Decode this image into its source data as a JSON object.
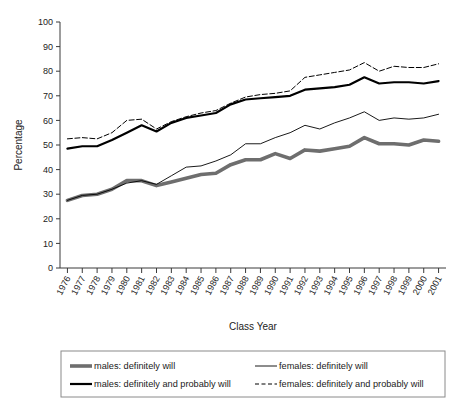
{
  "chart_data": {
    "type": "line",
    "title": "",
    "xlabel": "Class Year",
    "ylabel": "Percentage",
    "ylim": [
      0,
      100
    ],
    "ytick_step": 10,
    "yticks": [
      0,
      10,
      20,
      30,
      40,
      50,
      60,
      70,
      80,
      90,
      100
    ],
    "grid": false,
    "legend_position": "bottom",
    "x": [
      1976,
      1977,
      1978,
      1979,
      1980,
      1981,
      1982,
      1983,
      1984,
      1985,
      1986,
      1987,
      1988,
      1989,
      1990,
      1991,
      1992,
      1993,
      1994,
      1995,
      1996,
      1997,
      1998,
      1999,
      2000,
      2001
    ],
    "categories": [
      "1976",
      "1977",
      "1978",
      "1979",
      "1980",
      "1981",
      "1982",
      "1983",
      "1984",
      "1985",
      "1986",
      "1987",
      "1988",
      "1989",
      "1990",
      "1991",
      "1992",
      "1993",
      "1994",
      "1995",
      "1996",
      "1997",
      "1998",
      "1999",
      "2000",
      "2001"
    ],
    "series": [
      {
        "name": "males: definitely will",
        "style": "thick-gray",
        "color": "#6e6e6e",
        "values": [
          27.5,
          29.5,
          30.0,
          32.0,
          35.5,
          35.5,
          33.5,
          35.0,
          36.5,
          38.0,
          38.5,
          42.0,
          44.0,
          44.0,
          46.5,
          44.5,
          48.0,
          47.5,
          48.5,
          49.5,
          53.0,
          50.5,
          50.5,
          50.0,
          52.0,
          51.5
        ]
      },
      {
        "name": "males: definitely and probably will",
        "style": "thick-black",
        "color": "#000000",
        "values": [
          48.5,
          49.5,
          49.5,
          52.0,
          55.0,
          58.0,
          55.5,
          59.0,
          61.0,
          62.0,
          63.0,
          66.5,
          68.5,
          69.0,
          69.5,
          70.0,
          72.5,
          73.0,
          73.5,
          74.5,
          77.5,
          75.0,
          75.5,
          75.5,
          75.0,
          76.0
        ]
      },
      {
        "name": "females: definitely will",
        "style": "thin-black",
        "color": "#000000",
        "values": [
          27.5,
          29.5,
          30.0,
          32.0,
          34.5,
          35.5,
          34.0,
          37.5,
          41.0,
          41.5,
          43.5,
          46.0,
          50.5,
          50.5,
          53.0,
          55.0,
          58.0,
          56.5,
          59.0,
          61.0,
          63.5,
          60.0,
          61.0,
          60.5,
          61.0,
          62.5
        ]
      },
      {
        "name": "females: definitely and probably will",
        "style": "dashed-black",
        "color": "#000000",
        "values": [
          52.5,
          53.0,
          52.5,
          55.0,
          60.0,
          60.5,
          56.5,
          59.5,
          61.5,
          63.0,
          64.0,
          67.0,
          69.5,
          70.5,
          71.0,
          72.0,
          77.5,
          78.5,
          79.5,
          80.5,
          83.5,
          80.0,
          82.0,
          81.5,
          81.5,
          83.0
        ]
      }
    ]
  },
  "axes": {
    "ylabel": "Percentage",
    "xlabel": "Class Year"
  },
  "legend": {
    "entries": [
      {
        "label": "males: definitely will",
        "style": "thick-gray"
      },
      {
        "label": "females: definitely will",
        "style": "thin-black"
      },
      {
        "label": "males: definitely and probably will",
        "style": "thick-black"
      },
      {
        "label": "females: definitely and probably will",
        "style": "dashed-black"
      }
    ]
  }
}
